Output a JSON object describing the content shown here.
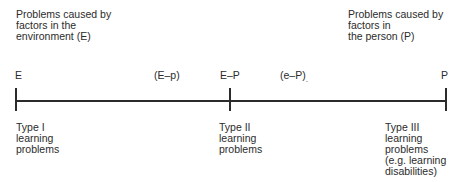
{
  "top": {
    "left_heading": "Problems caused by\nfactors in the\nenvironment (E)",
    "right_heading": "Problems caused by\nfactors in\nthe person (P)"
  },
  "axis": {
    "labels": {
      "left_end": "E",
      "left_mid": "(E–p)",
      "center": "E–P",
      "right_mid": "(e–P)",
      "right_end": "P"
    },
    "right_mid_mark": "."
  },
  "bottom": {
    "type1": "Type I\nlearning\nproblems",
    "type2": "Type II\nlearning\nproblems",
    "type3": "Type III\nlearning\nproblems\n(e.g. learning\ndisabilities)"
  },
  "colors": {
    "ink": "#2b2b2b",
    "background": "#ffffff"
  }
}
